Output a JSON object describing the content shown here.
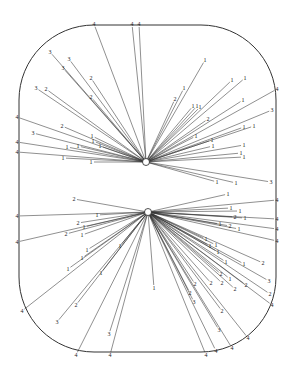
{
  "figure": {
    "type": "radial network diagram in rounded-rectangle frame",
    "frame": {
      "x": 19,
      "y": 25,
      "w": 257,
      "h": 327,
      "r": 75
    },
    "hubs": [
      {
        "id": "hub-upper",
        "x": 146,
        "y": 162
      },
      {
        "id": "hub-lower",
        "x": 148,
        "y": 212
      }
    ],
    "edges": [
      {
        "hub": 0,
        "x": 94,
        "y": 24,
        "label": "4"
      },
      {
        "hub": 0,
        "x": 132,
        "y": 24,
        "label": "4"
      },
      {
        "hub": 0,
        "x": 139,
        "y": 24,
        "label": "4"
      },
      {
        "hub": 0,
        "x": 50,
        "y": 52,
        "label": "3"
      },
      {
        "hub": 0,
        "x": 69,
        "y": 59,
        "label": "3"
      },
      {
        "hub": 0,
        "x": 63,
        "y": 68,
        "label": "3"
      },
      {
        "hub": 0,
        "x": 91,
        "y": 78,
        "label": "2"
      },
      {
        "hub": 0,
        "x": 36,
        "y": 88,
        "label": "3"
      },
      {
        "hub": 0,
        "x": 46,
        "y": 89,
        "label": "2"
      },
      {
        "hub": 0,
        "x": 91,
        "y": 97,
        "label": "2"
      },
      {
        "hub": 0,
        "x": 17,
        "y": 117,
        "label": "4"
      },
      {
        "hub": 0,
        "x": 33,
        "y": 133,
        "label": "3"
      },
      {
        "hub": 0,
        "x": 62,
        "y": 126,
        "label": "2"
      },
      {
        "hub": 0,
        "x": 92,
        "y": 136,
        "label": "1"
      },
      {
        "hub": 0,
        "x": 93,
        "y": 141,
        "label": "1"
      },
      {
        "hub": 0,
        "x": 100,
        "y": 146,
        "label": "1"
      },
      {
        "hub": 0,
        "x": 17,
        "y": 142,
        "label": "4"
      },
      {
        "hub": 0,
        "x": 17,
        "y": 152,
        "label": "4"
      },
      {
        "hub": 0,
        "x": 67,
        "y": 147,
        "label": "1"
      },
      {
        "hub": 0,
        "x": 78,
        "y": 146,
        "label": "1"
      },
      {
        "hub": 0,
        "x": 63,
        "y": 158,
        "label": "1"
      },
      {
        "hub": 0,
        "x": 91,
        "y": 162,
        "label": "1"
      },
      {
        "hub": 0,
        "x": 205,
        "y": 60,
        "label": "1"
      },
      {
        "hub": 0,
        "x": 184,
        "y": 88,
        "label": "1"
      },
      {
        "hub": 0,
        "x": 175,
        "y": 99,
        "label": "2"
      },
      {
        "hub": 0,
        "x": 232,
        "y": 80,
        "label": "1"
      },
      {
        "hub": 0,
        "x": 245,
        "y": 78,
        "label": "1"
      },
      {
        "hub": 0,
        "x": 193,
        "y": 106,
        "label": "1"
      },
      {
        "hub": 0,
        "x": 197,
        "y": 106,
        "label": "1"
      },
      {
        "hub": 0,
        "x": 200,
        "y": 107,
        "label": "1"
      },
      {
        "hub": 0,
        "x": 243,
        "y": 100,
        "label": "1"
      },
      {
        "hub": 0,
        "x": 208,
        "y": 119,
        "label": "2"
      },
      {
        "hub": 0,
        "x": 277,
        "y": 89,
        "label": "4"
      },
      {
        "hub": 0,
        "x": 272,
        "y": 110,
        "label": "3"
      },
      {
        "hub": 0,
        "x": 244,
        "y": 127,
        "label": "1"
      },
      {
        "hub": 0,
        "x": 254,
        "y": 126,
        "label": "1"
      },
      {
        "hub": 0,
        "x": 196,
        "y": 136,
        "label": "1"
      },
      {
        "hub": 0,
        "x": 212,
        "y": 140,
        "label": "1"
      },
      {
        "hub": 0,
        "x": 213,
        "y": 146,
        "label": "1"
      },
      {
        "hub": 0,
        "x": 244,
        "y": 145,
        "label": "1"
      },
      {
        "hub": 0,
        "x": 241,
        "y": 153,
        "label": "1"
      },
      {
        "hub": 0,
        "x": 244,
        "y": 157,
        "label": "1"
      },
      {
        "hub": 0,
        "x": 271,
        "y": 182,
        "label": "3"
      },
      {
        "hub": 0,
        "x": 217,
        "y": 182,
        "label": "1"
      },
      {
        "hub": 0,
        "x": 236,
        "y": 183,
        "label": "1"
      },
      {
        "hub": 1,
        "x": 17,
        "y": 216,
        "label": "4"
      },
      {
        "hub": 1,
        "x": 17,
        "y": 242,
        "label": "4"
      },
      {
        "hub": 1,
        "x": 74,
        "y": 199,
        "label": "2"
      },
      {
        "hub": 1,
        "x": 97,
        "y": 215,
        "label": "1"
      },
      {
        "hub": 1,
        "x": 78,
        "y": 223,
        "label": "2"
      },
      {
        "hub": 1,
        "x": 84,
        "y": 227,
        "label": "1"
      },
      {
        "hub": 1,
        "x": 66,
        "y": 234,
        "label": "2"
      },
      {
        "hub": 1,
        "x": 82,
        "y": 235,
        "label": "1"
      },
      {
        "hub": 1,
        "x": 87,
        "y": 250,
        "label": "1"
      },
      {
        "hub": 1,
        "x": 82,
        "y": 258,
        "label": "1"
      },
      {
        "hub": 1,
        "x": 68,
        "y": 269,
        "label": "1"
      },
      {
        "hub": 1,
        "x": 101,
        "y": 273,
        "label": "1"
      },
      {
        "hub": 1,
        "x": 120,
        "y": 246,
        "label": "1"
      },
      {
        "hub": 1,
        "x": 22,
        "y": 311,
        "label": "4"
      },
      {
        "hub": 1,
        "x": 76,
        "y": 305,
        "label": "2"
      },
      {
        "hub": 1,
        "x": 57,
        "y": 322,
        "label": "3"
      },
      {
        "hub": 1,
        "x": 109,
        "y": 334,
        "label": "3"
      },
      {
        "hub": 1,
        "x": 76,
        "y": 355,
        "label": "4"
      },
      {
        "hub": 1,
        "x": 110,
        "y": 355,
        "label": "4"
      },
      {
        "hub": 1,
        "x": 154,
        "y": 288,
        "label": "1"
      },
      {
        "hub": 1,
        "x": 228,
        "y": 194,
        "label": "1"
      },
      {
        "hub": 1,
        "x": 231,
        "y": 208,
        "label": "1"
      },
      {
        "hub": 1,
        "x": 277,
        "y": 200,
        "label": "4"
      },
      {
        "hub": 1,
        "x": 277,
        "y": 219,
        "label": "4"
      },
      {
        "hub": 1,
        "x": 277,
        "y": 229,
        "label": "4"
      },
      {
        "hub": 1,
        "x": 277,
        "y": 241,
        "label": "4"
      },
      {
        "hub": 1,
        "x": 240,
        "y": 211,
        "label": "1"
      },
      {
        "hub": 1,
        "x": 235,
        "y": 217,
        "label": "2"
      },
      {
        "hub": 1,
        "x": 245,
        "y": 218,
        "label": "1"
      },
      {
        "hub": 1,
        "x": 220,
        "y": 224,
        "label": "1"
      },
      {
        "hub": 1,
        "x": 230,
        "y": 226,
        "label": "2"
      },
      {
        "hub": 1,
        "x": 239,
        "y": 229,
        "label": "1"
      },
      {
        "hub": 1,
        "x": 206,
        "y": 239,
        "label": "1"
      },
      {
        "hub": 1,
        "x": 210,
        "y": 246,
        "label": "1"
      },
      {
        "hub": 1,
        "x": 216,
        "y": 245,
        "label": "1"
      },
      {
        "hub": 1,
        "x": 218,
        "y": 252,
        "label": "1"
      },
      {
        "hub": 1,
        "x": 226,
        "y": 262,
        "label": "1"
      },
      {
        "hub": 1,
        "x": 244,
        "y": 264,
        "label": "1"
      },
      {
        "hub": 1,
        "x": 263,
        "y": 263,
        "label": "2"
      },
      {
        "hub": 1,
        "x": 221,
        "y": 274,
        "label": "2"
      },
      {
        "hub": 1,
        "x": 230,
        "y": 279,
        "label": "1"
      },
      {
        "hub": 1,
        "x": 211,
        "y": 283,
        "label": "2"
      },
      {
        "hub": 1,
        "x": 222,
        "y": 283,
        "label": "2"
      },
      {
        "hub": 1,
        "x": 235,
        "y": 289,
        "label": "2"
      },
      {
        "hub": 1,
        "x": 246,
        "y": 285,
        "label": "2"
      },
      {
        "hub": 1,
        "x": 195,
        "y": 284,
        "label": "2"
      },
      {
        "hub": 1,
        "x": 190,
        "y": 293,
        "label": "2"
      },
      {
        "hub": 1,
        "x": 269,
        "y": 281,
        "label": "3"
      },
      {
        "hub": 1,
        "x": 270,
        "y": 294,
        "label": "2"
      },
      {
        "hub": 1,
        "x": 272,
        "y": 305,
        "label": "4"
      },
      {
        "hub": 1,
        "x": 194,
        "y": 302,
        "label": "3"
      },
      {
        "hub": 1,
        "x": 222,
        "y": 311,
        "label": "2"
      },
      {
        "hub": 1,
        "x": 219,
        "y": 330,
        "label": "3"
      },
      {
        "hub": 1,
        "x": 248,
        "y": 338,
        "label": "4"
      },
      {
        "hub": 1,
        "x": 232,
        "y": 348,
        "label": "4"
      },
      {
        "hub": 1,
        "x": 216,
        "y": 351,
        "label": "4"
      },
      {
        "hub": 1,
        "x": 206,
        "y": 355,
        "label": "4"
      }
    ]
  }
}
